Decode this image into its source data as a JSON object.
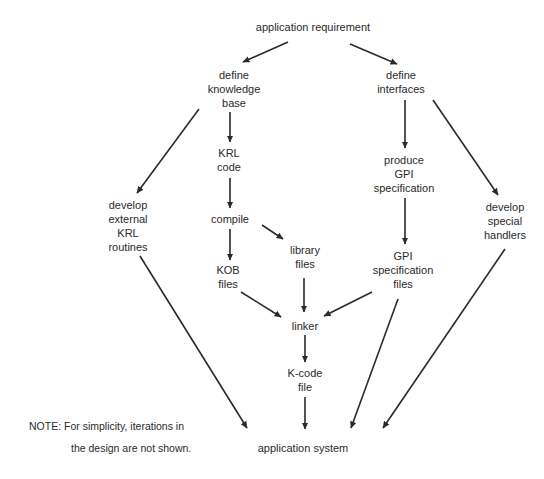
{
  "diagram": {
    "type": "flowchart",
    "nodes": {
      "app_req": {
        "lines": [
          "application requirement"
        ]
      },
      "define_kb": {
        "lines": [
          "define",
          "knowledge",
          "base"
        ]
      },
      "define_if": {
        "lines": [
          "define",
          "interfaces"
        ]
      },
      "krl_code": {
        "lines": [
          "KRL",
          "code"
        ]
      },
      "dev_ext": {
        "lines": [
          "develop",
          "external",
          "KRL",
          "routines"
        ]
      },
      "compile": {
        "lines": [
          "compile"
        ]
      },
      "library": {
        "lines": [
          "library",
          "files"
        ]
      },
      "kob": {
        "lines": [
          "KOB",
          "files"
        ]
      },
      "produce_gpi": {
        "lines": [
          "produce",
          "GPI",
          "specification"
        ]
      },
      "dev_special": {
        "lines": [
          "develop",
          "special",
          "handlers"
        ]
      },
      "gpi_files": {
        "lines": [
          "GPI",
          "specification",
          "files"
        ]
      },
      "linker": {
        "lines": [
          "linker"
        ]
      },
      "kcode": {
        "lines": [
          "K-code",
          "file"
        ]
      },
      "app_sys": {
        "lines": [
          "application system"
        ]
      }
    },
    "edges": [
      {
        "from": "application requirement",
        "to": "define knowledge base"
      },
      {
        "from": "application requirement",
        "to": "define interfaces"
      },
      {
        "from": "define knowledge base",
        "to": "KRL code"
      },
      {
        "from": "define knowledge base",
        "to": "develop external KRL routines"
      },
      {
        "from": "KRL code",
        "to": "compile"
      },
      {
        "from": "compile",
        "to": "KOB files"
      },
      {
        "from": "compile",
        "to": "library files"
      },
      {
        "from": "define interfaces",
        "to": "produce GPI specification"
      },
      {
        "from": "define interfaces",
        "to": "develop special handlers"
      },
      {
        "from": "produce GPI specification",
        "to": "GPI specification files"
      },
      {
        "from": "KOB files",
        "to": "linker"
      },
      {
        "from": "library files",
        "to": "linker"
      },
      {
        "from": "GPI specification files",
        "to": "linker"
      },
      {
        "from": "linker",
        "to": "K-code file"
      },
      {
        "from": "K-code file",
        "to": "application system"
      },
      {
        "from": "develop external KRL routines",
        "to": "application system"
      },
      {
        "from": "GPI specification files",
        "to": "application system"
      },
      {
        "from": "develop special handlers",
        "to": "application system"
      }
    ],
    "note": {
      "line1": "NOTE: For simplicity, iterations in",
      "line2": "the design are not shown."
    },
    "colors": {
      "background": "#ffffff",
      "ink": "#2a2a2a"
    }
  }
}
